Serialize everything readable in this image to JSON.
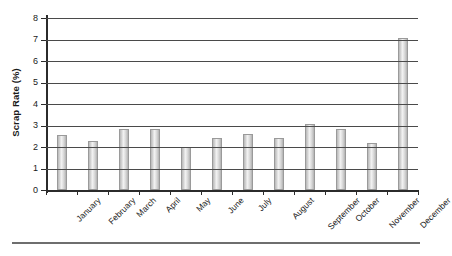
{
  "chart_data": {
    "type": "bar",
    "title": "",
    "xlabel": "",
    "ylabel": "Scrap Rate (%)",
    "ylim": [
      0,
      8
    ],
    "yticks": [
      0,
      1,
      2,
      3,
      4,
      5,
      6,
      7,
      8
    ],
    "ytick_labels": [
      "0",
      "1",
      "2",
      "3",
      "4",
      "5",
      "6",
      "7",
      "8"
    ],
    "grid": true,
    "legend": "none",
    "categories": [
      "January",
      "February",
      "March",
      "April",
      "May",
      "June",
      "July",
      "August",
      "September",
      "October",
      "November",
      "December"
    ],
    "values": [
      2.55,
      2.3,
      2.85,
      2.85,
      2.0,
      2.4,
      2.6,
      2.4,
      3.05,
      2.85,
      2.2,
      7.05
    ],
    "series": [
      {
        "name": "Scrap Rate",
        "values": [
          2.55,
          2.3,
          2.85,
          2.85,
          2.0,
          2.4,
          2.6,
          2.4,
          3.05,
          2.85,
          2.2,
          7.05
        ]
      }
    ]
  },
  "style": {
    "bar_fill": "#dcdcdc",
    "bar_edge": "#9a9a9a",
    "gridline_color": "#4a4a4a",
    "axis_color": "#2b2b2b",
    "text_color": "#1a1a1a",
    "background": "#ffffff",
    "rule_color": "#6e6e6e"
  }
}
